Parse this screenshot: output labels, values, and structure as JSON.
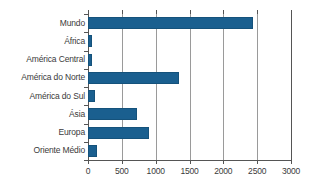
{
  "chart_data": {
    "type": "bar",
    "orientation": "horizontal",
    "title": "",
    "subtitle": "",
    "xlabel": "",
    "ylabel": "",
    "categories": [
      "Mundo",
      "África",
      "América Central",
      "América do Norte",
      "América do Sul",
      "Ásia",
      "Europa",
      "Oriente Médio"
    ],
    "values": [
      2437,
      55,
      55,
      1350,
      100,
      725,
      900,
      140
    ],
    "series": [
      {
        "name": "",
        "values": [
          2437,
          55,
          55,
          1350,
          100,
          725,
          900,
          140
        ]
      }
    ],
    "xlim": [
      0,
      3000
    ],
    "xticks": [
      0,
      500,
      1000,
      1500,
      2000,
      2500,
      3000
    ],
    "xtick_labels": [
      "0",
      "500",
      "1000",
      "1500",
      "2000",
      "2500",
      "3000"
    ],
    "grid": true,
    "grid_axis": "x",
    "legend": false,
    "legend_position": "none",
    "bar_color": "#1a5f8f",
    "grid_color": "#9a9a9a",
    "axis_color": "#555555",
    "text_color": "#3a3a3a",
    "background": "#ffffff"
  }
}
